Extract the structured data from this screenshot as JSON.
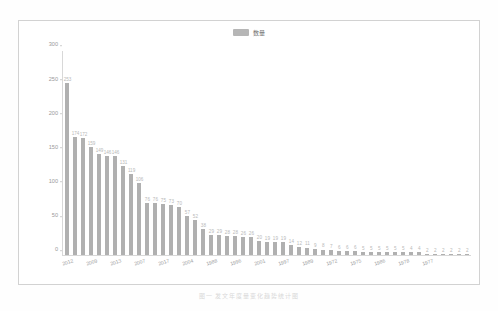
{
  "legend": {
    "swatch_color": "#b6b6b6",
    "label": "数量"
  },
  "caption": "图一    发文年度量变化趋势统计图",
  "colors": {
    "bar": "#b0b0b0",
    "axis": "#d8d8d8",
    "tick_text": "#9a9a9a",
    "value_text": "#b9b9b9",
    "frame": "#d2d2d2",
    "background": "#ffffff"
  },
  "chart_data": {
    "type": "bar",
    "title": "",
    "xlabel": "",
    "ylabel": "",
    "ylim": [
      0,
      300
    ],
    "yticks": [
      0,
      50,
      100,
      150,
      200,
      250,
      300
    ],
    "grid": false,
    "legend_position": "top-center",
    "series": [
      {
        "name": "数量",
        "values": [
          253,
          174,
          172,
          159,
          149,
          146,
          146,
          131,
          119,
          106,
          76,
          76,
          75,
          73,
          70,
          57,
          52,
          38,
          29,
          29,
          28,
          28,
          26,
          26,
          20,
          19,
          19,
          19,
          14,
          12,
          11,
          9,
          8,
          7,
          6,
          6,
          6,
          5,
          5,
          5,
          5,
          5,
          5,
          4,
          4,
          2,
          2,
          2,
          2,
          2,
          2
        ]
      }
    ],
    "categories": [
      "2012",
      "",
      "",
      "2009",
      "",
      "",
      "2013",
      "",
      "",
      "2007",
      "",
      "",
      "2017",
      "",
      "",
      "2004",
      "",
      "",
      "1988",
      "",
      "",
      "1996",
      "",
      "",
      "2001",
      "",
      "",
      "1997",
      "",
      "",
      "1989",
      "",
      "",
      "1972",
      "",
      "",
      "1975",
      "",
      "",
      "1986",
      "",
      "",
      "1978",
      "",
      "",
      "1977",
      "",
      "",
      "",
      "",
      ""
    ],
    "visible_xtick_labels": [
      "2012",
      "2009",
      "2013",
      "2007",
      "2017",
      "2004",
      "1988",
      "1996",
      "2001",
      "1997",
      "1989",
      "1972",
      "1975",
      "1986",
      "1978",
      "1977"
    ]
  }
}
